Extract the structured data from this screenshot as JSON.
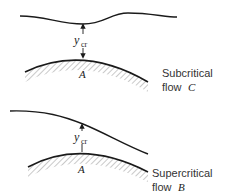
{
  "panels": [
    {
      "id": "subcritical",
      "depth_symbol": "y",
      "depth_subscript": "cr",
      "point_label": "A",
      "caption_line1": "Subcritical",
      "caption_line2": "flow",
      "caption_flow_letter": "C"
    },
    {
      "id": "supercritical",
      "depth_symbol": "y",
      "depth_subscript": "cr",
      "point_label": "A",
      "caption_line1": "Supercritical",
      "caption_line2": "flow",
      "caption_flow_letter": "B"
    }
  ],
  "colors": {
    "line": "#1a1a1a",
    "hatch": "#666666"
  }
}
